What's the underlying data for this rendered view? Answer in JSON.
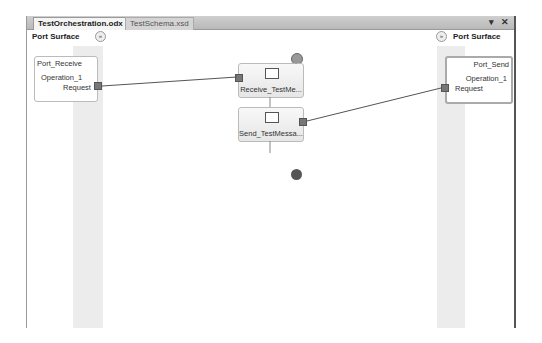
{
  "tabs": [
    {
      "label": "TestOrchestration.odx",
      "active": true
    },
    {
      "label": "TestSchema.xsd",
      "active": false
    }
  ],
  "window_controls": {
    "dropdown": "▾",
    "close": "✕"
  },
  "left_surface": {
    "title": "Port Surface",
    "collapse_icon": "«"
  },
  "right_surface": {
    "title": "Port Surface",
    "collapse_icon": "»"
  },
  "left_port": {
    "name": "Port_Receive",
    "operation": "Operation_1",
    "message": "Request"
  },
  "right_port": {
    "name": "Port_Send",
    "operation": "Operation_1",
    "message": "Request"
  },
  "shapes": [
    {
      "label": "Receive_TestMe...",
      "type": "receive"
    },
    {
      "label": "Send_TestMessa...",
      "type": "send"
    }
  ]
}
